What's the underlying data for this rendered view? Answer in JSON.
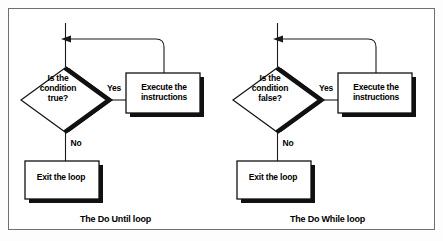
{
  "figure": {
    "type": "flowchart-pair",
    "background_color": "#ffffff",
    "border_color": "#6e6e6e",
    "shape_fill": "#ffffff",
    "shape_stroke": "#000000",
    "shadow_color": "#000000"
  },
  "diagrams": [
    {
      "id": "do-until",
      "caption": "The Do Until loop",
      "decision": {
        "line1": "Is the",
        "line2": "condition",
        "line3": "true?",
        "text": "Is the condition true?"
      },
      "process": {
        "line1": "Execute the",
        "line2": "instructions",
        "text": "Execute the instructions"
      },
      "terminal": {
        "text": "Exit the loop"
      },
      "branches": {
        "yes": "Yes",
        "no": "No"
      }
    },
    {
      "id": "do-while",
      "caption": "The Do While loop",
      "decision": {
        "line1": "Is the",
        "line2": "condition",
        "line3": "false?",
        "text": "Is the condition false?"
      },
      "process": {
        "line1": "Execute the",
        "line2": "instructions",
        "text": "Execute the instructions"
      },
      "terminal": {
        "text": "Exit the loop"
      },
      "branches": {
        "yes": "Yes",
        "no": "No"
      }
    }
  ]
}
